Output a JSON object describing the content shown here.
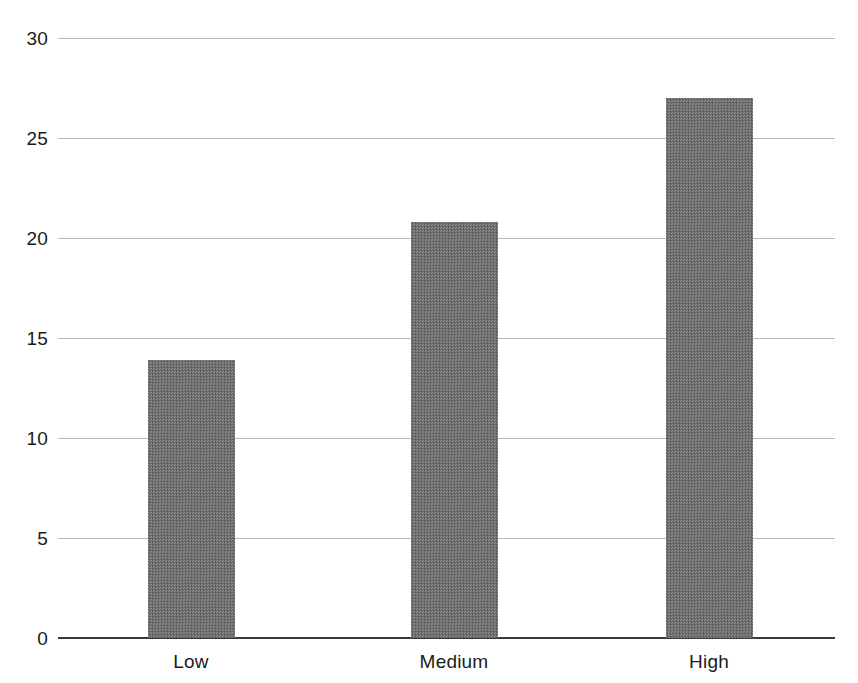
{
  "chart_data": {
    "type": "bar",
    "title": "",
    "subtitle": "",
    "xlabel": "",
    "ylabel": "",
    "categories": [
      "Low",
      "Medium",
      "High"
    ],
    "values": [
      13.9,
      20.8,
      27.0
    ],
    "series": [
      {
        "name": "",
        "values": [
          13.9,
          20.8,
          27.0
        ]
      }
    ],
    "ylim": [
      0,
      30
    ],
    "yticks": [
      0,
      5,
      10,
      15,
      20,
      25,
      30
    ],
    "ytick_labels": [
      "0",
      "5",
      "10",
      "15",
      "20",
      "25",
      "30"
    ],
    "grid": true,
    "grid_axis": "y",
    "legend": false,
    "legend_position": "none",
    "annotations": [],
    "colors": {
      "bar_fill": "#6e6e6e",
      "gridline": "#b9b9b9",
      "axis_line": "#3a3a3a",
      "text": "#1b1b1b",
      "background": "#ffffff"
    }
  }
}
